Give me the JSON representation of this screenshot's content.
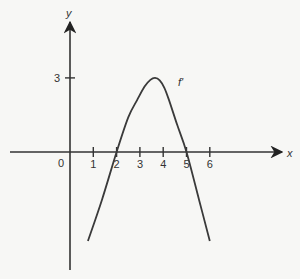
{
  "chart_data": {
    "type": "line",
    "title": "",
    "xlabel": "x",
    "ylabel": "y",
    "origin_label": "0",
    "x_ticks": [
      1,
      2,
      3,
      4,
      5,
      6
    ],
    "x_tick_labels": [
      "1",
      "2",
      "3",
      "4",
      "5",
      "6"
    ],
    "y_ticks": [
      3
    ],
    "y_tick_labels": [
      "3"
    ],
    "xlim": [
      -0.5,
      7.5
    ],
    "ylim": [
      -5,
      6
    ],
    "grid": false,
    "series": [
      {
        "name": "f'",
        "label": "f'",
        "x": [
          0.77,
          1.37,
          2.0,
          2.5,
          2.88,
          3.2,
          3.45,
          3.65,
          3.85,
          4.05,
          4.25,
          4.6,
          5.0,
          5.54,
          6.0
        ],
        "y": [
          -3.6,
          -1.94,
          0.0,
          1.4,
          2.1,
          2.65,
          2.92,
          3.0,
          2.9,
          2.6,
          2.1,
          1.1,
          0.0,
          -1.94,
          -3.6
        ]
      }
    ]
  }
}
